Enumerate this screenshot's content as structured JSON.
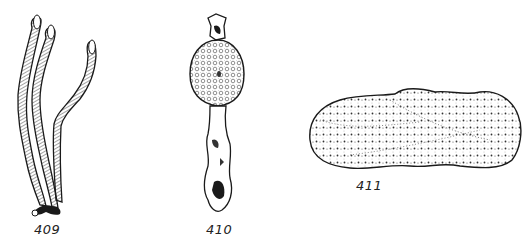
{
  "figure": {
    "specimens": [
      {
        "id": "409",
        "label": "409",
        "form": "three slender branching stalks with elongated rounded tips"
      },
      {
        "id": "410",
        "label": "410",
        "form": "stalked organism with knobby ovoid warty head"
      },
      {
        "id": "411",
        "label": "411",
        "form": "elongated stippled lumpy body"
      }
    ],
    "colors": {
      "ink": "#1a1a1a",
      "paper": "#ffffff",
      "shade": "#555555"
    }
  }
}
